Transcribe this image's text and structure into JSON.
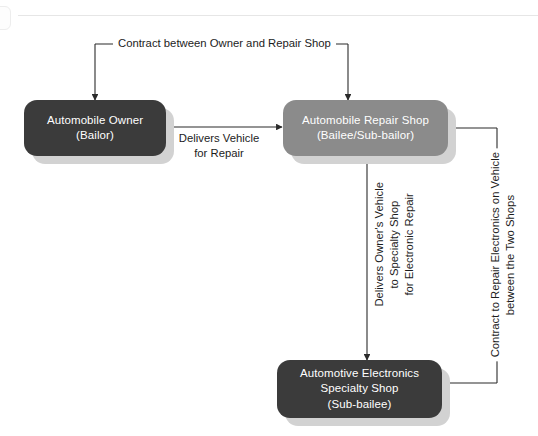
{
  "diagram": {
    "background_color": "#ffffff",
    "nodes": [
      {
        "id": "owner",
        "label": "Automobile Owner\n(Bailor)",
        "color": "#3b3b3b",
        "text_color": "#ffffff"
      },
      {
        "id": "repair_shop",
        "label": "Automobile Repair Shop\n(Bailee/Sub-bailor)",
        "color": "#8b8b8b",
        "text_color": "#ffffff"
      },
      {
        "id": "specialty_shop",
        "label": "Automotive Electronics\nSpecialty Shop\n(Sub-bailee)",
        "color": "#3b3b3b",
        "text_color": "#ffffff"
      }
    ],
    "edges": [
      {
        "id": "contract_owner_repair",
        "label": "Contract between Owner and Repair Shop",
        "from": "owner",
        "to": "repair_shop",
        "orientation": "horizontal",
        "arrowheads": "both"
      },
      {
        "id": "delivers_vehicle",
        "label": "Delivers Vehicle\nfor Repair",
        "from": "owner",
        "to": "repair_shop",
        "orientation": "horizontal",
        "arrowheads": "end"
      },
      {
        "id": "delivers_specialty",
        "label": "Delivers Owner's Vehicle\nto Specialty Shop\nfor Electronic Repair",
        "from": "repair_shop",
        "to": "specialty_shop",
        "orientation": "vertical",
        "arrowheads": "end"
      },
      {
        "id": "contract_two_shops",
        "label": "Contract to Repair Electronics on Vehicle\nbetween the Two Shops",
        "from": "specialty_shop",
        "to": "repair_shop",
        "orientation": "vertical",
        "arrowheads": "both"
      }
    ],
    "line_color": "#2b2b2b",
    "shadow_color": "#d2d2d2"
  }
}
